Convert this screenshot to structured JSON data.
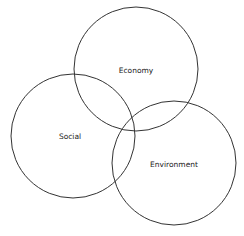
{
  "diagram": {
    "type": "venn",
    "stroke_color": "#333333",
    "circles": [
      {
        "label": "Economy",
        "cx": 136,
        "cy": 69,
        "r": 62,
        "label_x": 136,
        "label_y": 70
      },
      {
        "label": "Social",
        "cx": 73,
        "cy": 136,
        "r": 62,
        "label_x": 70,
        "label_y": 136
      },
      {
        "label": "Environment",
        "cx": 174,
        "cy": 163,
        "r": 62,
        "label_x": 174,
        "label_y": 164
      }
    ]
  }
}
